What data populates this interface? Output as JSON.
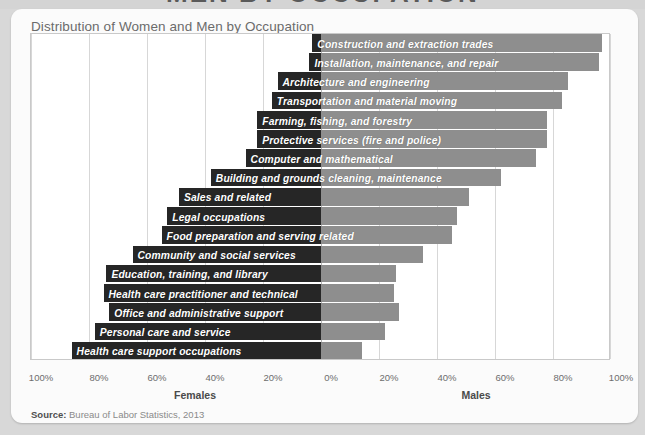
{
  "page": {
    "cropped_banner_title": "MEN BY OCCUPATION",
    "background_color": "#d8d8d8"
  },
  "card": {
    "title": "Distribution of Women and Men by Occupation",
    "source_prefix": "Source:",
    "source_text": " Bureau of Labor Statistics, 2013"
  },
  "axis": {
    "females_caption": "Females",
    "males_caption": "Males",
    "ticks": [
      "100%",
      "80%",
      "60%",
      "40%",
      "20%",
      "0%",
      "20%",
      "40%",
      "60%",
      "80%",
      "100%"
    ]
  },
  "colors": {
    "female_bar": "#262626",
    "male_bar": "#8e8e8e",
    "grid": "#d7d7d7",
    "axis_zero": "#b4b4b4",
    "card_bg": "#fbfbfb",
    "label_text": "#ffffff"
  },
  "chart_data": {
    "type": "bar",
    "subtype": "diverging-horizontal-stacked-100",
    "title": "Distribution of Women and Men by Occupation",
    "xlabel": "",
    "ylabel": "",
    "xlim": [
      -100,
      100
    ],
    "xticks": [
      -100,
      -80,
      -60,
      -40,
      -20,
      0,
      20,
      40,
      60,
      80,
      100
    ],
    "xticklabels": [
      "100%",
      "80%",
      "60%",
      "40%",
      "20%",
      "0%",
      "20%",
      "40%",
      "60%",
      "80%",
      "100%"
    ],
    "grid": true,
    "legend": false,
    "left_axis_name": "Females",
    "right_axis_name": "Males",
    "source": "Bureau of Labor Statistics, 2013",
    "categories": [
      "Construction and extraction trades",
      "Installation, maintenance, and repair",
      "Architecture and engineering",
      "Transportation and material moving",
      "Farming, fishing, and forestry",
      "Protective services (fire and police)",
      "Computer and mathematical",
      "Building and grounds cleaning, maintenance",
      "Sales and related",
      "Legal occupations",
      "Food preparation and serving related",
      "Community and social services",
      "Education, training, and library",
      "Health care practitioner and technical",
      "Office and administrative support",
      "Personal care and service",
      "Health care support occupations"
    ],
    "series": [
      {
        "name": "Females",
        "values": [
          3,
          4,
          15,
          17,
          22,
          22,
          26,
          38,
          49,
          53,
          55,
          65,
          74,
          75,
          73,
          78,
          86
        ]
      },
      {
        "name": "Males",
        "values": [
          97,
          96,
          85,
          83,
          78,
          78,
          74,
          62,
          51,
          47,
          45,
          35,
          26,
          25,
          27,
          22,
          14
        ]
      }
    ]
  }
}
